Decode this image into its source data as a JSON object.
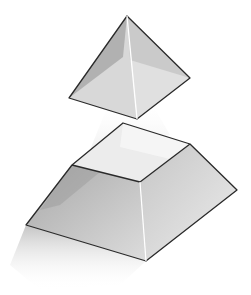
{
  "figure": {
    "title": "Exploded square pyramid (apex pyramid separated from frustum)",
    "parts": [
      {
        "name": "apex-pyramid",
        "label": "Top pyramid"
      },
      {
        "name": "frustum",
        "label": "Truncated pyramid base"
      }
    ],
    "colors": {
      "edge": "#2a2a2a",
      "face_light": "#e6e6e6",
      "face_mid": "#d2d2d2",
      "face_dark": "#b4b4b4",
      "top_face": "#ececec",
      "shadow": "#c8c8c8"
    }
  }
}
